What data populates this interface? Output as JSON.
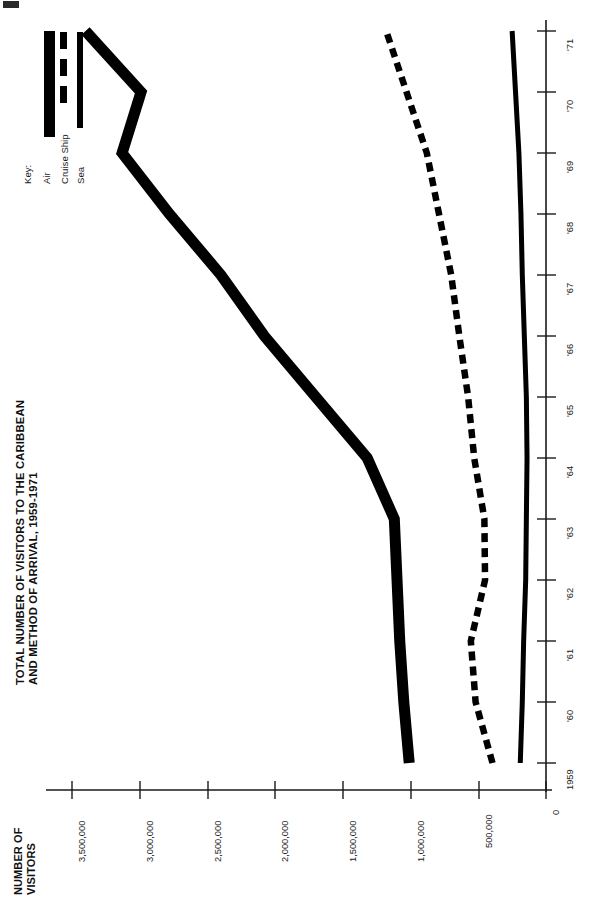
{
  "title": {
    "line1": "TOTAL NUMBER OF VISITORS TO THE CARIBBEAN",
    "line2": "AND METHOD OF ARRIVAL, 1959-1971"
  },
  "axis_title": {
    "line1": "NUMBER OF",
    "line2": "VISITORS"
  },
  "legend": {
    "heading": "Key:",
    "items": [
      {
        "label": "Air",
        "style": "thick-solid"
      },
      {
        "label": "Cruise Ship",
        "style": "dashed"
      },
      {
        "label": "Sea",
        "style": "solid"
      }
    ]
  },
  "chart_data": {
    "type": "line",
    "title": "TOTAL NUMBER OF VISITORS TO THE CARIBBEAN AND METHOD OF ARRIVAL, 1959-1971",
    "xlabel": "",
    "ylabel": "NUMBER OF VISITORS",
    "orientation": "rotated-90",
    "grid": false,
    "legend_position": "top-left",
    "categories": [
      "1959",
      "'60",
      "'61",
      "'62",
      "'63",
      "'64",
      "'65",
      "'66",
      "'67",
      "'68",
      "'69",
      "'70",
      "'71"
    ],
    "x": [
      1959,
      1960,
      1961,
      1962,
      1963,
      1964,
      1965,
      1966,
      1967,
      1968,
      1969,
      1970,
      1971
    ],
    "xtick_labels": [
      "1959",
      "'60",
      "'61",
      "'62",
      "'63",
      "'64",
      "'65",
      "'66",
      "'67",
      "'68",
      "'69",
      "'70",
      "'71"
    ],
    "ytick_labels": [
      "0",
      "500,000",
      "1,000,000",
      "1,500,000",
      "2,000,000",
      "2,500,000",
      "3,000,000",
      "3,500,000"
    ],
    "ytick_values": [
      0,
      500000,
      1000000,
      1500000,
      2000000,
      2500000,
      3000000,
      3500000
    ],
    "ylim": [
      0,
      3600000
    ],
    "series": [
      {
        "name": "Air",
        "style": "thick-solid",
        "values": [
          1010000,
          1050000,
          1080000,
          1100000,
          1120000,
          1320000,
          1700000,
          2080000,
          2400000,
          2780000,
          3130000,
          2990000,
          3400000
        ]
      },
      {
        "name": "Cruise Ship",
        "style": "dashed",
        "values": [
          395000,
          520000,
          555000,
          450000,
          455000,
          530000,
          575000,
          640000,
          700000,
          790000,
          880000,
          1030000,
          1180000
        ]
      },
      {
        "name": "Sea",
        "style": "solid",
        "values": [
          190000,
          175000,
          165000,
          150000,
          145000,
          140000,
          145000,
          160000,
          175000,
          185000,
          200000,
          225000,
          250000
        ]
      }
    ]
  }
}
